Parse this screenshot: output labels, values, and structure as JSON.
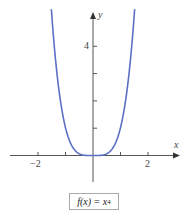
{
  "chart_data": {
    "type": "line",
    "title": "",
    "caption": "f(x) = x^4",
    "function": "x^4",
    "xlabel": "x",
    "ylabel": "y",
    "xlim": [
      -3,
      3
    ],
    "ylim": [
      -1.8,
      5.2
    ],
    "x_ticks": [
      -2,
      -1,
      1,
      2
    ],
    "x_tick_labels": [
      "−2",
      "2"
    ],
    "y_ticks": [
      1,
      2,
      3,
      4
    ],
    "y_tick_labels": [
      "4"
    ],
    "grid": false,
    "line_color": "#5b6fc4",
    "x": [
      -1.5,
      -1.25,
      -1,
      -0.75,
      -0.5,
      -0.25,
      0,
      0.25,
      0.5,
      0.75,
      1,
      1.25,
      1.5
    ],
    "series": [
      {
        "name": "f(x) = x^4",
        "values": [
          5.06,
          2.44,
          1,
          0.32,
          0.06,
          0.004,
          0,
          0.004,
          0.06,
          0.32,
          1,
          2.44,
          5.06
        ]
      }
    ]
  },
  "labels": {
    "x_axis": "x",
    "y_axis": "y",
    "x_neg2": "−2",
    "x_pos2": "2",
    "y_4": "4",
    "caption_prefix": "f(x) = x",
    "caption_exp": "4"
  }
}
